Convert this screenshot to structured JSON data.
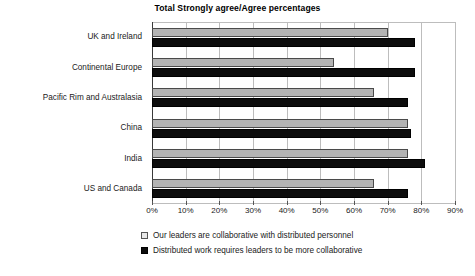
{
  "chart_data": {
    "type": "bar",
    "orientation": "horizontal",
    "title": "Total Strongly agree/Agree percentages",
    "xlabel": "",
    "ylabel": "",
    "xlim": [
      0,
      90
    ],
    "xticks": [
      0,
      10,
      20,
      30,
      40,
      50,
      60,
      70,
      80,
      90
    ],
    "xtick_labels": [
      "0%",
      "10%",
      "20%",
      "30%",
      "40%",
      "50%",
      "60%",
      "70%",
      "80%",
      "90%"
    ],
    "grid": true,
    "grid_axis": "x",
    "legend_position": "bottom",
    "categories": [
      "UK and Ireland",
      "Continental Europe",
      "Pacific Rim and Australasia",
      "China",
      "India",
      "US and Canada"
    ],
    "series": [
      {
        "name": "Our leaders are collaborative with distributed personnel",
        "color": "#b3b3b3",
        "values": [
          70,
          54,
          66,
          76,
          76,
          66
        ]
      },
      {
        "name": "Distributed work requires leaders to be more collaborative",
        "color": "#0d0d0d",
        "values": [
          78,
          78,
          76,
          77,
          81,
          76
        ]
      }
    ]
  },
  "legend": {
    "items": [
      {
        "label": "Our leaders are collaborative with distributed personnel",
        "swatch": "gray"
      },
      {
        "label": "Distributed work requires leaders to be more collaborative",
        "swatch": "black"
      }
    ]
  },
  "colors": {
    "series_gray": "#b3b3b3",
    "series_black": "#0d0d0d",
    "gridline": "#bdbdbd",
    "axis": "#3a3a3a",
    "background": "#ffffff",
    "text": "#1a1a1a"
  }
}
